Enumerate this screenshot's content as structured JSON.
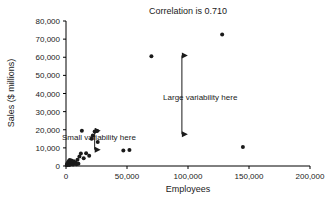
{
  "chart_data": {
    "type": "scatter",
    "title": "Correlation is 0.710",
    "xlabel": "Employees",
    "ylabel": "Sales ($ millions)",
    "xlim": [
      0,
      200000
    ],
    "ylim": [
      0,
      80000
    ],
    "grid": false,
    "legend": "none",
    "correlation": 0.71,
    "xticks": [
      0,
      50000,
      100000,
      150000,
      200000
    ],
    "xticklabels": [
      "0",
      "50,000",
      "100,000",
      "150,000",
      "200,000"
    ],
    "yticks": [
      0,
      10000,
      20000,
      30000,
      40000,
      50000,
      60000,
      70000,
      80000
    ],
    "yticklabels": [
      "0",
      "10,000",
      "20,000",
      "30,000",
      "40,000",
      "50,000",
      "60,000",
      "70,000",
      "80,000"
    ],
    "points": [
      {
        "x": 600,
        "y": 400
      },
      {
        "x": 900,
        "y": 900
      },
      {
        "x": 1200,
        "y": 1500
      },
      {
        "x": 1500,
        "y": 700
      },
      {
        "x": 1800,
        "y": 2100
      },
      {
        "x": 2100,
        "y": 1200
      },
      {
        "x": 2400,
        "y": 2800
      },
      {
        "x": 2700,
        "y": 500
      },
      {
        "x": 3000,
        "y": 3300
      },
      {
        "x": 3300,
        "y": 1800
      },
      {
        "x": 3600,
        "y": 2400
      },
      {
        "x": 4000,
        "y": 1000
      },
      {
        "x": 4400,
        "y": 3000
      },
      {
        "x": 4800,
        "y": 1600
      },
      {
        "x": 5200,
        "y": 2200
      },
      {
        "x": 5800,
        "y": 800
      },
      {
        "x": 6400,
        "y": 2600
      },
      {
        "x": 7000,
        "y": 1400
      },
      {
        "x": 7800,
        "y": 2000
      },
      {
        "x": 8600,
        "y": 900
      },
      {
        "x": 9400,
        "y": 3500
      },
      {
        "x": 10200,
        "y": 1300
      },
      {
        "x": 11000,
        "y": 5200
      },
      {
        "x": 12200,
        "y": 6900
      },
      {
        "x": 13000,
        "y": 19500
      },
      {
        "x": 14500,
        "y": 4300
      },
      {
        "x": 16500,
        "y": 7000
      },
      {
        "x": 19000,
        "y": 5600
      },
      {
        "x": 21000,
        "y": 15000
      },
      {
        "x": 22000,
        "y": 16800
      },
      {
        "x": 23500,
        "y": 19000
      },
      {
        "x": 25500,
        "y": 19300
      },
      {
        "x": 26000,
        "y": 13200
      },
      {
        "x": 47000,
        "y": 8500
      },
      {
        "x": 52000,
        "y": 8800
      },
      {
        "x": 70000,
        "y": 60500
      },
      {
        "x": 128000,
        "y": 72500
      },
      {
        "x": 145000,
        "y": 10500
      }
    ],
    "annotations": [
      {
        "id": "small-variability",
        "text": "Small variability here",
        "text_x": 27000,
        "text_y": 14500,
        "arrow_x": 23500,
        "arrow_y_top": 19500,
        "arrow_y_bottom": 9000,
        "arrow_style": "double-headed-vertical"
      },
      {
        "id": "large-variability",
        "text": "Large variability here",
        "text_x": 110000,
        "text_y": 36500,
        "arrow_x": 95000,
        "arrow_y_top": 61000,
        "arrow_y_bottom": 17500,
        "arrow_style": "double-headed-vertical"
      }
    ],
    "colors": {
      "point": "#1a1a1a",
      "axis": "#000000",
      "text": "#1a1a1a",
      "background": "#ffffff"
    }
  }
}
